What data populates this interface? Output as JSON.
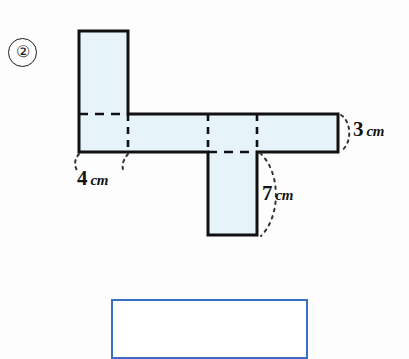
{
  "problem": {
    "number_label": "②",
    "number_icon": "circled-number-2"
  },
  "figure": {
    "name": "box-net-diagram",
    "fill_color": "#e6f3f8",
    "stroke_color": "#111111",
    "fold_line_style": "dashed",
    "labels": [
      {
        "id": "width",
        "value": "4",
        "unit": "cm"
      },
      {
        "id": "height",
        "value": "3",
        "unit": "cm"
      },
      {
        "id": "depth",
        "value": "7",
        "unit": "cm"
      }
    ]
  },
  "dimensions": {
    "width": {
      "value": "4",
      "unit": "cm"
    },
    "height": {
      "value": "3",
      "unit": "cm"
    },
    "depth": {
      "value": "7",
      "unit": "cm"
    }
  },
  "answer_box": {
    "name": "answer-entry-box",
    "value": "",
    "placeholder": "",
    "border_color": "#3b6fc4"
  }
}
